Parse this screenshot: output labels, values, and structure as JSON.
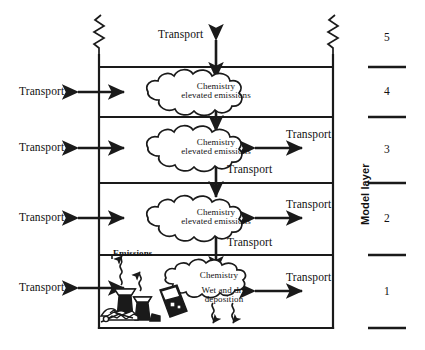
{
  "diagram": {
    "box": {
      "left": 99,
      "right": 333,
      "top": 55,
      "bottom": 328
    },
    "ink_color": "#1a1a1a",
    "background": "#ffffff"
  },
  "top_transport": {
    "label": "Transport"
  },
  "left_transport": [
    {
      "label": "Transport",
      "layer": 4
    },
    {
      "label": "Transport",
      "layer": 3
    },
    {
      "label": "Transport",
      "layer": 2
    },
    {
      "label": "Transport",
      "layer": 1
    }
  ],
  "right_transport": [
    {
      "label": "Transport",
      "layer": 3
    },
    {
      "label": "Transport",
      "layer": 2
    },
    {
      "label": "Transport",
      "layer": 1
    }
  ],
  "inner_transport": [
    {
      "label": "Transport",
      "between": "layer 3 and layer 2"
    },
    {
      "label": "Transport",
      "between": "layer 2 and layer 1"
    }
  ],
  "clouds": [
    {
      "line1": "Chemistry",
      "line2": "elevated emissions",
      "layer": 4
    },
    {
      "line1": "Chemistry",
      "line2": "elevated emissions",
      "layer": 3
    },
    {
      "line1": "Chemistry",
      "line2": "elevated emissions",
      "layer": 2
    },
    {
      "line1": "Chemistry",
      "line2": "",
      "layer": 1
    }
  ],
  "emissions": {
    "label": "Emissions"
  },
  "deposition": {
    "line1": "Wet and dry",
    "line2": "deposition"
  },
  "ruler": {
    "axis_label": "Model layer",
    "layers": [
      {
        "number": "5"
      },
      {
        "number": "4"
      },
      {
        "number": "3"
      },
      {
        "number": "2"
      },
      {
        "number": "1"
      }
    ]
  }
}
